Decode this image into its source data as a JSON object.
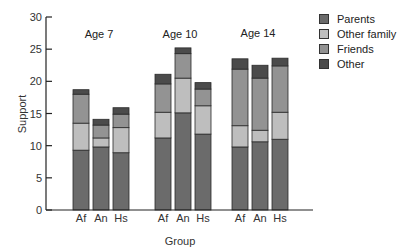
{
  "chart_data": {
    "type": "bar",
    "stacked": true,
    "title": "",
    "xlabel": "Group",
    "ylabel": "Support",
    "ylim": [
      0,
      30
    ],
    "yticks": [
      0,
      5,
      10,
      15,
      20,
      25,
      30
    ],
    "grid": false,
    "legend_position": "upper right",
    "age_groups": [
      "Age 7",
      "Age 10",
      "Age 14"
    ],
    "categories": [
      "Af",
      "An",
      "Hs",
      "Af",
      "An",
      "Hs",
      "Af",
      "An",
      "Hs"
    ],
    "series": [
      {
        "name": "Parents",
        "color": "#6b6b6b",
        "values": [
          9.3,
          9.8,
          8.9,
          11.2,
          15.1,
          11.8,
          9.8,
          10.6,
          11.0
        ]
      },
      {
        "name": "Other family",
        "color": "#bebebe",
        "values": [
          4.2,
          1.4,
          3.9,
          4.0,
          5.4,
          4.4,
          3.3,
          1.8,
          4.2
        ]
      },
      {
        "name": "Friends",
        "color": "#939393",
        "values": [
          4.5,
          2.0,
          2.1,
          4.4,
          3.8,
          2.6,
          8.8,
          8.1,
          7.2
        ]
      },
      {
        "name": "Other",
        "color": "#4b4b4b",
        "values": [
          0.7,
          0.9,
          1.0,
          1.5,
          0.9,
          1.0,
          1.6,
          2.0,
          1.2
        ]
      }
    ],
    "totals": [
      18.7,
      14.1,
      15.9,
      21.1,
      25.2,
      19.8,
      23.5,
      22.5,
      23.6
    ]
  },
  "legend": {
    "items": [
      {
        "label": "Parents",
        "color": "#6b6b6b"
      },
      {
        "label": "Other family",
        "color": "#bebebe"
      },
      {
        "label": "Friends",
        "color": "#939393"
      },
      {
        "label": "Other",
        "color": "#4b4b4b"
      }
    ]
  },
  "axes": {
    "x_title": "Group",
    "y_title": "Support"
  }
}
